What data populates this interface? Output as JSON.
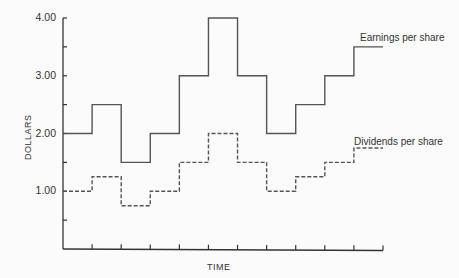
{
  "chart_data": {
    "type": "line",
    "subtype": "step",
    "title": "",
    "xlabel": "TIME",
    "ylabel": "DOLLARS",
    "ylim": [
      0,
      4
    ],
    "yticks": [
      "1.00",
      "2.00",
      "3.00",
      "4.00"
    ],
    "x": [
      1,
      2,
      3,
      4,
      5,
      6,
      7,
      8,
      9,
      10,
      11
    ],
    "grid": false,
    "legend_position": "inline labels at right",
    "series": [
      {
        "name": "Earnings per share",
        "style": "solid",
        "values": [
          2.0,
          2.5,
          1.5,
          2.0,
          3.0,
          4.0,
          3.0,
          2.0,
          2.5,
          3.0,
          3.5
        ]
      },
      {
        "name": "Dividends per share",
        "style": "dashed",
        "values": [
          1.0,
          1.25,
          0.75,
          1.0,
          1.5,
          2.0,
          1.5,
          1.0,
          1.25,
          1.5,
          1.75
        ]
      }
    ],
    "colors": {
      "line": "#555555",
      "axis": "#333333"
    }
  }
}
